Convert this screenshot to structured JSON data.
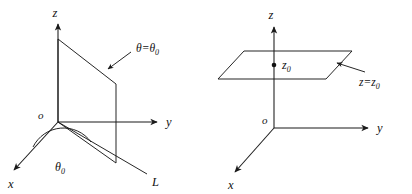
{
  "figure": {
    "kind": "math-geometry-diagram",
    "ink_color": "#1a1a1a",
    "background_color": "#ffffff",
    "panels": [
      {
        "id": "left",
        "name": "theta-constant-half-plane",
        "axes": {
          "z_label": "z",
          "y_label": "y",
          "x_label": "x",
          "origin_label": "o"
        },
        "surface_label": "θ=θ₀",
        "surface_label_parts": {
          "lhs": "θ",
          "eq": "=",
          "rhs_base": "θ",
          "rhs_sub": "0"
        },
        "angle_label": "θ₀",
        "angle_label_parts": {
          "base": "θ",
          "sub": "0"
        },
        "line_label": "L"
      },
      {
        "id": "right",
        "name": "z-constant-plane",
        "axes": {
          "z_label": "z",
          "y_label": "y",
          "x_label": "x",
          "origin_label": "o"
        },
        "surface_label": "z=z₀",
        "surface_label_parts": {
          "lhs": "z",
          "eq": "=",
          "rhs_base": "z",
          "rhs_sub": "0"
        },
        "height_label": "z₀",
        "height_label_parts": {
          "base": "z",
          "sub": "0"
        }
      }
    ]
  }
}
